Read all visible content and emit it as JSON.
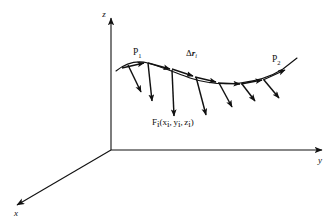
{
  "figure": {
    "background_color": "#ffffff",
    "stroke_color": "#111111",
    "width": 336,
    "height": 224
  },
  "axes": {
    "origin": {
      "x": 111,
      "y": 150
    },
    "z": {
      "name": "z-axis",
      "label": "z",
      "label_x": 104,
      "label_y": 17,
      "from": {
        "x": 111,
        "y": 150
      },
      "to": {
        "x": 111,
        "y": 18
      }
    },
    "y": {
      "name": "y-axis",
      "label": "y",
      "label_x": 320,
      "label_y": 163,
      "from": {
        "x": 111,
        "y": 150
      },
      "to": {
        "x": 322,
        "y": 150
      }
    },
    "x": {
      "name": "x-axis",
      "label": "x",
      "label_x": 16,
      "label_y": 216,
      "from": {
        "x": 111,
        "y": 150
      },
      "to": {
        "x": 17,
        "y": 205
      }
    }
  },
  "curve": {
    "name": "path-curve",
    "description": "Curved path from P1 to P2 along which the force acts",
    "path": "M 116 71 C 126 63 136 60 148 63 C 162 67 176 73 190 78 C 205 83 222 85 240 83 C 258 81 272 76 283 69 C 288 65 292 62 297 58"
  },
  "labels": {
    "p1": {
      "text": "P",
      "sub": "1",
      "x": 133,
      "y": 55
    },
    "p2": {
      "text": "P",
      "sub": "2",
      "x": 272,
      "y": 62
    },
    "delta_r": {
      "prefix": "Δ",
      "symbol": "r",
      "sub": "i",
      "x": 186,
      "y": 56
    },
    "force": {
      "bold_symbol": "F",
      "sub": "i",
      "open": "(",
      "x_var": "x",
      "x_sub": "i",
      "comma1": ",",
      "y_var": "y",
      "y_sub": "i",
      "comma2": ",",
      "z_var": "z",
      "z_sub": "i",
      "close": ")",
      "x": 152,
      "y": 125
    }
  },
  "tangent_vectors": {
    "name": "delta-r-tangent-arrows",
    "description": "Short arrows tangent to the curve representing the displacement increments",
    "items": [
      {
        "x1": 122,
        "y1": 68,
        "x2": 144,
        "y2": 63
      },
      {
        "x1": 148,
        "y1": 63,
        "x2": 170,
        "y2": 69
      },
      {
        "x1": 172,
        "y1": 69,
        "x2": 193,
        "y2": 76
      },
      {
        "x1": 195,
        "y1": 77,
        "x2": 216,
        "y2": 82
      },
      {
        "x1": 218,
        "y1": 83,
        "x2": 240,
        "y2": 84
      },
      {
        "x1": 241,
        "y1": 84,
        "x2": 262,
        "y2": 80
      },
      {
        "x1": 263,
        "y1": 80,
        "x2": 285,
        "y2": 70
      }
    ]
  },
  "force_vectors": {
    "name": "force-arrows",
    "description": "Downward arrows representing the force F_i at each sample point on the curve",
    "items": [
      {
        "x1": 128,
        "y1": 65,
        "x2": 141,
        "y2": 92
      },
      {
        "x1": 148,
        "y1": 63,
        "x2": 152,
        "y2": 101
      },
      {
        "x1": 172,
        "y1": 70,
        "x2": 174,
        "y2": 116
      },
      {
        "x1": 196,
        "y1": 77,
        "x2": 206,
        "y2": 115
      },
      {
        "x1": 219,
        "y1": 83,
        "x2": 232,
        "y2": 107
      },
      {
        "x1": 242,
        "y1": 84,
        "x2": 255,
        "y2": 101
      },
      {
        "x1": 264,
        "y1": 80,
        "x2": 279,
        "y2": 98
      }
    ]
  }
}
